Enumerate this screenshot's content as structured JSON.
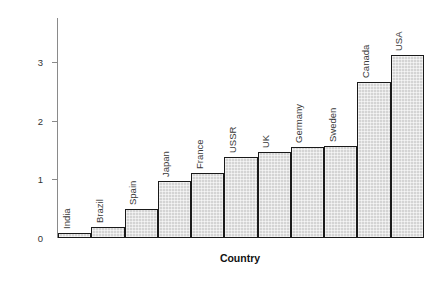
{
  "chart_data": {
    "type": "bar",
    "title": "",
    "xlabel": "Country",
    "ylabel": "Energy consumption per person/× 10¹¹ J",
    "ylabel_parts": {
      "prefix": "Energy consumption per person/× 10",
      "exponent": "11",
      "suffix": " J"
    },
    "categories": [
      "India",
      "Brazil",
      "Spain",
      "Japan",
      "France",
      "USSR",
      "UK",
      "Germany",
      "Sweden",
      "Canada",
      "USA"
    ],
    "values": [
      0.08,
      0.19,
      0.49,
      0.98,
      1.11,
      1.38,
      1.46,
      1.55,
      1.57,
      2.66,
      3.12
    ],
    "ylim": [
      0,
      3.75
    ],
    "yticks": [
      1,
      2,
      3
    ],
    "ytick_labels": [
      "1",
      "2",
      "3"
    ],
    "y_zero_label": "0",
    "grid": false,
    "legend": null,
    "bar_fill_color": "#d4d4d4",
    "bar_edge_color": "#1a1a1a",
    "axis_color": "#8a8a8a",
    "text_color": "#111111"
  }
}
